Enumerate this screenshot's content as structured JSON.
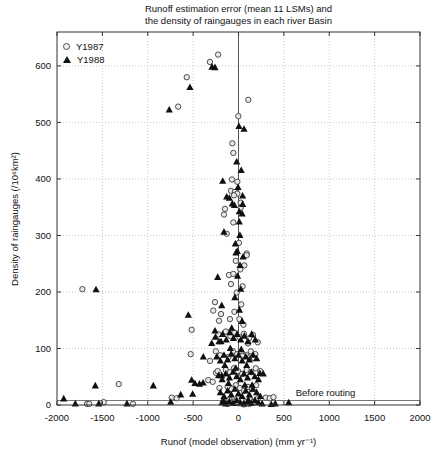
{
  "title": {
    "line1": "Runoff estimation error (mean 11 LSMs) and",
    "line2": "the density of raingauges in each river Basin"
  },
  "legend": [
    {
      "label": "Y1987",
      "marker": "circle"
    },
    {
      "label": "Y1988",
      "marker": "triangle"
    }
  ],
  "annotation": {
    "text": "Before routing",
    "x": 630,
    "y": 30,
    "line_y": 8
  },
  "axes": {
    "xlabel": "Runof (model observation) (mm yr⁻¹)",
    "ylabel": "Density of raingauges (/10⁶km²)",
    "xlim": [
      -2000,
      2000
    ],
    "ylim": [
      0,
      660
    ],
    "xticks": [
      -2000,
      -1500,
      -1000,
      -500,
      0,
      500,
      1000,
      1500,
      2000
    ],
    "yticks": [
      0,
      100,
      200,
      300,
      400,
      500,
      600
    ],
    "grid": "dotted",
    "zero_line_x": 0,
    "legend_position": "top-left"
  },
  "colors": {
    "circle_fill": "#e8e8e8",
    "circle_stroke": "#3c3c3c",
    "triangle_fill": "#101010",
    "grid": "#bdbdbd",
    "axis": "#333333",
    "zero_line": "#555555",
    "ref_line": "#777777"
  },
  "chart_data": {
    "type": "scatter",
    "title": "Runoff estimation error (mean 11 LSMs) and the density of raingauges in each river Basin",
    "xlabel": "Runof (model observation) (mm yr-1)",
    "ylabel": "Density of raingauges (/10^6 km^2)",
    "xlim": [
      -2000,
      2000
    ],
    "ylim": [
      0,
      660
    ],
    "series": [
      {
        "name": "Y1987",
        "marker": "circle",
        "points": [
          [
            -225,
            620
          ],
          [
            -315,
            607
          ],
          [
            -570,
            580
          ],
          [
            -665,
            528
          ],
          [
            108,
            540
          ],
          [
            -2,
            511
          ],
          [
            -68,
            463
          ],
          [
            -57,
            446
          ],
          [
            -72,
            399
          ],
          [
            -13,
            395
          ],
          [
            -83,
            379
          ],
          [
            -39,
            377
          ],
          [
            -13,
            374
          ],
          [
            -50,
            371
          ],
          [
            24,
            358
          ],
          [
            24,
            349
          ],
          [
            -149,
            347
          ],
          [
            -160,
            337
          ],
          [
            -57,
            323
          ],
          [
            -130,
            303
          ],
          [
            5,
            287
          ],
          [
            90,
            268
          ],
          [
            90,
            265
          ],
          [
            64,
            247
          ],
          [
            -30,
            255
          ],
          [
            20,
            240
          ],
          [
            -105,
            230
          ],
          [
            -57,
            232
          ],
          [
            -83,
            214
          ],
          [
            45,
            210
          ],
          [
            -20,
            199
          ],
          [
            -259,
            182
          ],
          [
            -278,
            167
          ],
          [
            30,
            178
          ],
          [
            -193,
            161
          ],
          [
            -215,
            149
          ],
          [
            -94,
            152
          ],
          [
            -45,
            165
          ],
          [
            10,
            152
          ],
          [
            55,
            142
          ],
          [
            -1720,
            205
          ],
          [
            -1320,
            37
          ],
          [
            -1485,
            5
          ],
          [
            -1669,
            2
          ],
          [
            -1644,
            2
          ],
          [
            -1163,
            2
          ],
          [
            -516,
            133
          ],
          [
            -527,
            90
          ],
          [
            -736,
            13
          ],
          [
            -681,
            12
          ],
          [
            -314,
            78
          ],
          [
            -333,
            44
          ],
          [
            -284,
            41
          ],
          [
            -248,
            57
          ],
          [
            212,
            111
          ],
          [
            300,
            13
          ],
          [
            345,
            12
          ],
          [
            385,
            14
          ],
          [
            -220,
            125
          ],
          [
            -140,
            130
          ],
          [
            -90,
            122
          ],
          [
            -45,
            128
          ],
          [
            10,
            120
          ],
          [
            60,
            126
          ],
          [
            115,
            118
          ],
          [
            160,
            124
          ],
          [
            -250,
            95
          ],
          [
            -200,
            88
          ],
          [
            -110,
            85
          ],
          [
            -60,
            95
          ],
          [
            -15,
            90
          ],
          [
            35,
            92
          ],
          [
            85,
            88
          ],
          [
            135,
            95
          ],
          [
            185,
            90
          ],
          [
            105,
            109
          ],
          [
            39,
            87
          ],
          [
            123,
            84
          ],
          [
            171,
            83
          ],
          [
            -230,
            60
          ],
          [
            -140,
            62
          ],
          [
            -95,
            58
          ],
          [
            -50,
            65
          ],
          [
            -5,
            60
          ],
          [
            40,
            55
          ],
          [
            90,
            62
          ],
          [
            140,
            58
          ],
          [
            190,
            65
          ],
          [
            240,
            60
          ],
          [
            -210,
            30
          ],
          [
            -120,
            32
          ],
          [
            -75,
            28
          ],
          [
            -30,
            35
          ],
          [
            15,
            30
          ],
          [
            60,
            25
          ],
          [
            105,
            32
          ],
          [
            150,
            28
          ],
          [
            195,
            35
          ],
          [
            -145,
            5
          ],
          [
            -100,
            10
          ],
          [
            -55,
            6
          ],
          [
            -10,
            12
          ],
          [
            35,
            8
          ],
          [
            80,
            5
          ],
          [
            125,
            10
          ],
          [
            170,
            6
          ],
          [
            215,
            12
          ],
          [
            -120,
            2
          ],
          [
            0,
            3
          ],
          [
            120,
            2
          ],
          [
            60,
            1
          ]
        ]
      },
      {
        "name": "Y1988",
        "marker": "triangle",
        "points": [
          [
            -292,
            598
          ],
          [
            -259,
            597
          ],
          [
            -535,
            562
          ],
          [
            -763,
            522
          ],
          [
            5,
            493
          ],
          [
            61,
            488
          ],
          [
            -20,
            430
          ],
          [
            30,
            415
          ],
          [
            -174,
            396
          ],
          [
            -5,
            385
          ],
          [
            45,
            370
          ],
          [
            -130,
            368
          ],
          [
            -101,
            366
          ],
          [
            -68,
            356
          ],
          [
            -45,
            353
          ],
          [
            46,
            355
          ],
          [
            9,
            342
          ],
          [
            40,
            338
          ],
          [
            9,
            324
          ],
          [
            -160,
            306
          ],
          [
            15,
            300
          ],
          [
            -35,
            285
          ],
          [
            -13,
            272
          ],
          [
            -28,
            269
          ],
          [
            50,
            262
          ],
          [
            17,
            247
          ],
          [
            -229,
            226
          ],
          [
            -10,
            228
          ],
          [
            25,
            205
          ],
          [
            -40,
            190
          ],
          [
            -185,
            176
          ],
          [
            10,
            168
          ],
          [
            40,
            148
          ],
          [
            -75,
            136
          ],
          [
            -259,
            131
          ],
          [
            -193,
            112
          ],
          [
            -295,
            109
          ],
          [
            -1570,
            204
          ],
          [
            -1578,
            34
          ],
          [
            -1926,
            11
          ],
          [
            -1798,
            2
          ],
          [
            -1540,
            2
          ],
          [
            -1229,
            2
          ],
          [
            -939,
            34
          ],
          [
            -747,
            5
          ],
          [
            -637,
            18
          ],
          [
            -553,
            159
          ],
          [
            -516,
            44
          ],
          [
            -505,
            19
          ],
          [
            -480,
            38
          ],
          [
            -430,
            37
          ],
          [
            -390,
            39
          ],
          [
            -388,
            85
          ],
          [
            -185,
            52
          ],
          [
            234,
            56
          ],
          [
            273,
            55
          ],
          [
            361,
            1
          ],
          [
            405,
            2
          ],
          [
            553,
            4
          ],
          [
            -255,
            120
          ],
          [
            -215,
            112
          ],
          [
            -175,
            125
          ],
          [
            -135,
            115
          ],
          [
            -95,
            128
          ],
          [
            -55,
            118
          ],
          [
            -15,
            125
          ],
          [
            25,
            115
          ],
          [
            65,
            122
          ],
          [
            105,
            112
          ],
          [
            145,
            125
          ],
          [
            185,
            115
          ],
          [
            -240,
            85
          ],
          [
            -200,
            78
          ],
          [
            -160,
            88
          ],
          [
            -120,
            80
          ],
          [
            -80,
            90
          ],
          [
            -40,
            82
          ],
          [
            0,
            88
          ],
          [
            40,
            78
          ],
          [
            80,
            85
          ],
          [
            120,
            80
          ],
          [
            160,
            88
          ],
          [
            200,
            82
          ],
          [
            -90,
            100
          ],
          [
            30,
            98
          ],
          [
            -220,
            52
          ],
          [
            -180,
            45
          ],
          [
            -140,
            55
          ],
          [
            -100,
            48
          ],
          [
            -60,
            58
          ],
          [
            -20,
            50
          ],
          [
            20,
            45
          ],
          [
            60,
            55
          ],
          [
            100,
            48
          ],
          [
            140,
            58
          ],
          [
            180,
            50
          ],
          [
            220,
            45
          ],
          [
            -150,
            70
          ],
          [
            90,
            70
          ],
          [
            -30,
            65
          ],
          [
            -200,
            22
          ],
          [
            -160,
            15
          ],
          [
            -120,
            25
          ],
          [
            -80,
            18
          ],
          [
            -40,
            28
          ],
          [
            0,
            20
          ],
          [
            40,
            15
          ],
          [
            80,
            25
          ],
          [
            120,
            18
          ],
          [
            160,
            28
          ],
          [
            200,
            22
          ],
          [
            240,
            15
          ],
          [
            150,
            35
          ],
          [
            -110,
            38
          ],
          [
            70,
            35
          ],
          [
            -180,
            4
          ],
          [
            -140,
            2
          ],
          [
            -100,
            6
          ],
          [
            -60,
            3
          ],
          [
            -20,
            8
          ],
          [
            20,
            4
          ],
          [
            60,
            2
          ],
          [
            100,
            6
          ],
          [
            140,
            3
          ],
          [
            180,
            8
          ],
          [
            220,
            4
          ],
          [
            260,
            2
          ],
          [
            -170,
            8
          ],
          [
            110,
            8
          ]
        ]
      }
    ]
  }
}
